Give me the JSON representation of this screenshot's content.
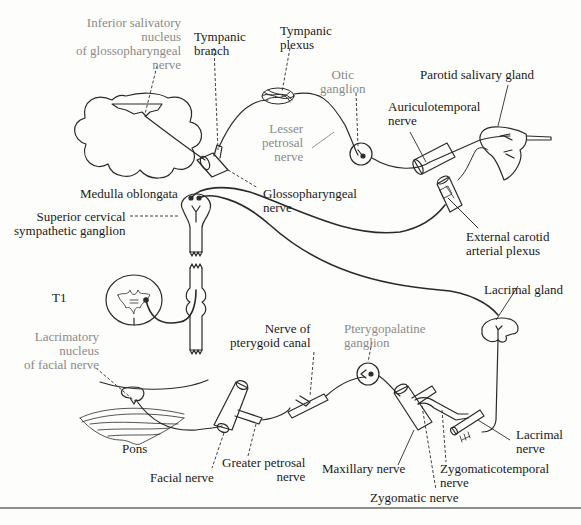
{
  "diagram": {
    "type": "anatomical-pathway",
    "colors": {
      "line": "#2a2a2a",
      "label_black": "#1a1a1a",
      "label_grey": "#8a8a8a",
      "rule": "#8f8f8f"
    },
    "labels": {
      "inferior_salivatory": [
        "Inferior salivatory",
        "nucleus",
        "of glossopharyngeal",
        "nerve"
      ],
      "tympanic_branch": [
        "Tympanic",
        "branch"
      ],
      "tympanic_plexus": [
        "Tympanic",
        "plexus"
      ],
      "otic_ganglion": [
        "Otic",
        "ganglion"
      ],
      "parotid_gland": "Parotid salivary gland",
      "auriculotemporal": [
        "Auriculotemporal",
        "nerve"
      ],
      "lesser_petrosal": [
        "Lesser",
        "petrosal",
        "nerve"
      ],
      "medulla": "Medulla oblongata",
      "glossopharyngeal": [
        "Glossopharyngeal",
        "nerve"
      ],
      "superior_cervical": [
        "Superior cervical",
        "sympathetic ganglion"
      ],
      "external_carotid": [
        "External carotid",
        "arterial plexus"
      ],
      "t1": "T1",
      "lacrimal_gland": "Lacrimal gland",
      "lacrimatory_nucleus": [
        "Lacrimatory",
        "nucleus",
        "of facial nerve"
      ],
      "nerve_pterygoid": [
        "Nerve of",
        "pterygoid canal"
      ],
      "pterygopalatine": [
        "Pterygopalatine",
        "ganglion"
      ],
      "pons": "Pons",
      "facial_nerve": "Facial nerve",
      "greater_petrosal": [
        "Greater petrosal",
        "nerve"
      ],
      "maxillary": "Maxillary nerve",
      "lacrimal_nerve": [
        "Lacrimal",
        "nerve"
      ],
      "zygomaticotemporal": [
        "Zygomaticotemporal",
        "nerve"
      ],
      "zygomatic": "Zygomatic nerve"
    },
    "label_styles": {
      "grey_labels": [
        "inferior_salivatory",
        "otic_ganglion",
        "lesser_petrosal",
        "lacrimatory_nucleus",
        "pterygopalatine"
      ]
    }
  }
}
